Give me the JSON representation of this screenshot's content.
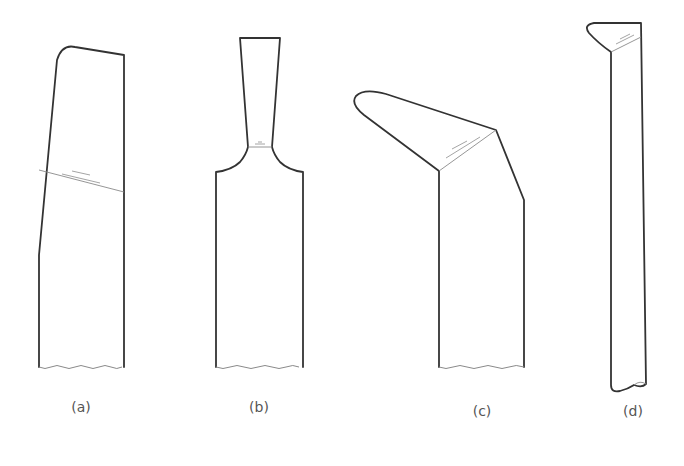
{
  "figure": {
    "type": "tool-bit-shapes",
    "panels": [
      {
        "id": "a",
        "caption": "(a)",
        "shape": "straight tool with angled cutting face"
      },
      {
        "id": "b",
        "caption": "(b)",
        "shape": "necked parting tool"
      },
      {
        "id": "c",
        "caption": "(c)",
        "shape": "bent tool with rounded nose"
      },
      {
        "id": "d",
        "caption": "(d)",
        "shape": "long tool with small bent tip"
      }
    ]
  },
  "colors": {
    "outline": "#333333",
    "thin_line": "#8a8a8a",
    "caption": "#555555",
    "background": "#ffffff"
  }
}
